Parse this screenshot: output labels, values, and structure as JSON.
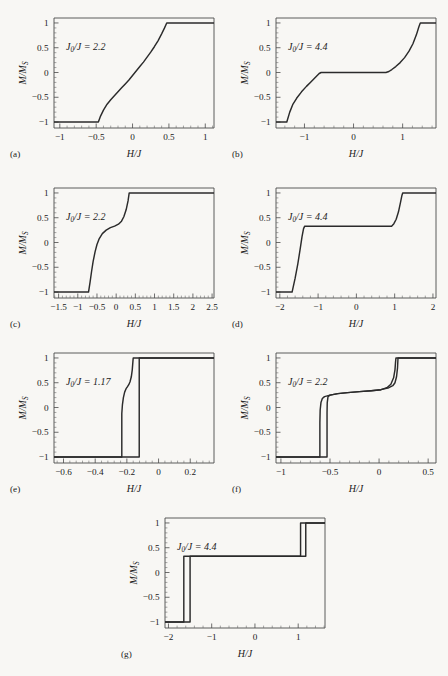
{
  "figure": {
    "background_color": "#f8f7f4",
    "curve_color": "#2b2b2b",
    "axis_color": "#4a4a4a",
    "y_axis_label": "M/M",
    "y_axis_label_sub": "S",
    "x_axis_label": "H/J",
    "annotation_prefix": "J",
    "annotation_sub": "0",
    "annotation_mid": "/J = "
  },
  "panels": [
    {
      "tag": "(a)",
      "annotation_value": "2.2",
      "annotation_full": "J0/J = 2.2",
      "x_ticks": [
        -1,
        -0.5,
        0,
        0.5,
        1
      ],
      "x_tick_labels": [
        "−1",
        "−0.5",
        "0",
        "0.5",
        "1"
      ],
      "y_ticks": [
        -1,
        -0.5,
        0,
        0.5,
        1
      ],
      "y_tick_labels": [
        "−1",
        "−0.5",
        "0",
        "0.5",
        "1"
      ],
      "xlim": [
        -1.08,
        1.12
      ],
      "ylim": [
        -1.12,
        1.1
      ]
    },
    {
      "tag": "(b)",
      "annotation_value": "4.4",
      "annotation_full": "J0/J = 4.4",
      "x_ticks": [
        -1,
        0,
        1
      ],
      "x_tick_labels": [
        "−1",
        "0",
        "1"
      ],
      "y_ticks": [
        -1,
        -0.5,
        0,
        0.5,
        1
      ],
      "y_tick_labels": [
        "−1",
        "−0.5",
        "0",
        "0.5",
        "1"
      ],
      "xlim": [
        -1.58,
        1.68
      ],
      "ylim": [
        -1.12,
        1.1
      ]
    },
    {
      "tag": "(c)",
      "annotation_value": "2.2",
      "annotation_full": "J0/J = 2.2",
      "x_ticks": [
        -1.5,
        -1,
        -0.5,
        0,
        0.5,
        1,
        1.5,
        2,
        2.5
      ],
      "x_tick_labels": [
        "−1.5",
        "−1",
        "−0.5",
        "0",
        "0.5",
        "1",
        "1.5",
        "2",
        "2.5"
      ],
      "y_ticks": [
        -1,
        -0.5,
        0,
        0.5,
        1
      ],
      "y_tick_labels": [
        "−1",
        "−0.5",
        "0",
        "0.5",
        "1"
      ],
      "xlim": [
        -1.62,
        2.55
      ],
      "ylim": [
        -1.12,
        1.1
      ]
    },
    {
      "tag": "(d)",
      "annotation_value": "4.4",
      "annotation_full": "J0/J = 4.4",
      "x_ticks": [
        -2,
        -1,
        0,
        1,
        2
      ],
      "x_tick_labels": [
        "−2",
        "−1",
        "0",
        "1",
        "2"
      ],
      "y_ticks": [
        -1,
        -0.5,
        0,
        0.5,
        1
      ],
      "y_tick_labels": [
        "−1",
        "−0.5",
        "0",
        "0.5",
        "1"
      ],
      "xlim": [
        -2.1,
        2.08
      ],
      "ylim": [
        -1.12,
        1.1
      ]
    },
    {
      "tag": "(e)",
      "annotation_value": "1.17",
      "annotation_full": "J0/J = 1.17",
      "x_ticks": [
        -0.6,
        -0.4,
        -0.2,
        0,
        0.2
      ],
      "x_tick_labels": [
        "−0.6",
        "−0.4",
        "−0.2",
        "0",
        "0.2"
      ],
      "y_ticks": [
        -1,
        -0.5,
        0,
        0.5,
        1
      ],
      "y_tick_labels": [
        "−1",
        "−0.5",
        "0",
        "0.5",
        "1"
      ],
      "xlim": [
        -0.66,
        0.35
      ],
      "ylim": [
        -1.12,
        1.1
      ]
    },
    {
      "tag": "(f)",
      "annotation_value": "2.2",
      "annotation_full": "J0/J = 2.2",
      "x_ticks": [
        -1,
        -0.5,
        0,
        0.5
      ],
      "x_tick_labels": [
        "−1",
        "−0.5",
        "0",
        "0.5"
      ],
      "y_ticks": [
        -1,
        -0.5,
        0,
        0.5,
        1
      ],
      "y_tick_labels": [
        "−1",
        "−0.5",
        "0",
        "0.5",
        "1"
      ],
      "xlim": [
        -1.05,
        0.58
      ],
      "ylim": [
        -1.12,
        1.1
      ]
    },
    {
      "tag": "(g)",
      "annotation_value": "4.4",
      "annotation_full": "J0/J = 4.4",
      "x_ticks": [
        -2,
        -1,
        0,
        1
      ],
      "x_tick_labels": [
        "−2",
        "−1",
        "0",
        "1"
      ],
      "y_ticks": [
        -1,
        -0.5,
        0,
        0.5,
        1
      ],
      "y_tick_labels": [
        "−1",
        "−0.5",
        "0",
        "0.5",
        "1"
      ],
      "xlim": [
        -2.08,
        1.62
      ],
      "ylim": [
        -1.12,
        1.1
      ]
    }
  ],
  "chart_data": [
    {
      "type": "line",
      "panel": "(a)",
      "title": "",
      "xlabel": "H/J",
      "ylabel": "M/M_S",
      "annotation": "J_0/J = 2.2",
      "xlim": [
        -1.08,
        1.12
      ],
      "ylim": [
        -1.12,
        1.1
      ],
      "grid": false,
      "legend": "none",
      "series": [
        {
          "name": "M/Ms vs H/J",
          "points": [
            [
              -1.08,
              -1.0
            ],
            [
              -0.47,
              -1.0
            ],
            [
              -0.44,
              -0.88
            ],
            [
              -0.4,
              -0.76
            ],
            [
              -0.35,
              -0.64
            ],
            [
              -0.3,
              -0.55
            ],
            [
              -0.25,
              -0.47
            ],
            [
              -0.2,
              -0.39
            ],
            [
              -0.15,
              -0.31
            ],
            [
              -0.1,
              -0.23
            ],
            [
              -0.05,
              -0.15
            ],
            [
              0.0,
              -0.06
            ],
            [
              0.05,
              0.03
            ],
            [
              0.1,
              0.12
            ],
            [
              0.15,
              0.21
            ],
            [
              0.2,
              0.31
            ],
            [
              0.25,
              0.41
            ],
            [
              0.3,
              0.52
            ],
            [
              0.35,
              0.64
            ],
            [
              0.4,
              0.78
            ],
            [
              0.44,
              0.9
            ],
            [
              0.47,
              1.0
            ],
            [
              1.12,
              1.0
            ]
          ]
        }
      ]
    },
    {
      "type": "line",
      "panel": "(b)",
      "xlabel": "H/J",
      "ylabel": "M/M_S",
      "annotation": "J_0/J = 4.4",
      "xlim": [
        -1.58,
        1.68
      ],
      "ylim": [
        -1.12,
        1.1
      ],
      "grid": false,
      "legend": "none",
      "series": [
        {
          "name": "M/Ms vs H/J",
          "points": [
            [
              -1.58,
              -1.0
            ],
            [
              -1.36,
              -1.0
            ],
            [
              -1.3,
              -0.8
            ],
            [
              -1.24,
              -0.65
            ],
            [
              -1.16,
              -0.52
            ],
            [
              -1.06,
              -0.39
            ],
            [
              -0.96,
              -0.28
            ],
            [
              -0.88,
              -0.2
            ],
            [
              -0.8,
              -0.12
            ],
            [
              -0.74,
              -0.06
            ],
            [
              -0.7,
              -0.02
            ],
            [
              -0.66,
              0.0
            ],
            [
              0.66,
              0.0
            ],
            [
              0.72,
              0.02
            ],
            [
              0.78,
              0.06
            ],
            [
              0.86,
              0.12
            ],
            [
              0.95,
              0.2
            ],
            [
              1.04,
              0.3
            ],
            [
              1.13,
              0.43
            ],
            [
              1.21,
              0.58
            ],
            [
              1.28,
              0.76
            ],
            [
              1.33,
              0.92
            ],
            [
              1.36,
              1.0
            ],
            [
              1.68,
              1.0
            ]
          ]
        }
      ]
    },
    {
      "type": "line",
      "panel": "(c)",
      "xlabel": "H/J",
      "ylabel": "M/M_S",
      "annotation": "J_0/J = 2.2",
      "xlim": [
        -1.62,
        2.55
      ],
      "ylim": [
        -1.12,
        1.1
      ],
      "grid": false,
      "legend": "none",
      "series": [
        {
          "name": "M/Ms vs H/J",
          "points": [
            [
              -1.62,
              -1.0
            ],
            [
              -0.72,
              -1.0
            ],
            [
              -0.68,
              -0.8
            ],
            [
              -0.64,
              -0.58
            ],
            [
              -0.6,
              -0.38
            ],
            [
              -0.55,
              -0.19
            ],
            [
              -0.5,
              -0.04
            ],
            [
              -0.44,
              0.08
            ],
            [
              -0.36,
              0.18
            ],
            [
              -0.26,
              0.25
            ],
            [
              -0.15,
              0.3
            ],
            [
              -0.04,
              0.33
            ],
            [
              0.06,
              0.37
            ],
            [
              0.14,
              0.43
            ],
            [
              0.2,
              0.52
            ],
            [
              0.26,
              0.66
            ],
            [
              0.31,
              0.84
            ],
            [
              0.34,
              1.0
            ],
            [
              2.55,
              1.0
            ]
          ]
        }
      ]
    },
    {
      "type": "line",
      "panel": "(d)",
      "xlabel": "H/J",
      "ylabel": "M/M_S",
      "annotation": "J_0/J = 4.4",
      "xlim": [
        -2.1,
        2.08
      ],
      "ylim": [
        -1.12,
        1.1
      ],
      "grid": false,
      "legend": "none",
      "series": [
        {
          "name": "M/Ms vs H/J",
          "points": [
            [
              -2.1,
              -1.0
            ],
            [
              -1.68,
              -1.0
            ],
            [
              -1.6,
              -0.72
            ],
            [
              -1.53,
              -0.43
            ],
            [
              -1.47,
              -0.14
            ],
            [
              -1.42,
              0.12
            ],
            [
              -1.38,
              0.28
            ],
            [
              -1.35,
              0.33
            ],
            [
              0.92,
              0.33
            ],
            [
              0.98,
              0.38
            ],
            [
              1.04,
              0.47
            ],
            [
              1.1,
              0.62
            ],
            [
              1.15,
              0.8
            ],
            [
              1.19,
              0.95
            ],
            [
              1.21,
              1.0
            ],
            [
              2.08,
              1.0
            ]
          ]
        }
      ]
    },
    {
      "type": "line",
      "panel": "(e)",
      "xlabel": "H/J",
      "ylabel": "M/M_S",
      "annotation": "J_0/J = 1.17",
      "xlim": [
        -0.66,
        0.35
      ],
      "ylim": [
        -1.12,
        1.1
      ],
      "grid": false,
      "legend": "none",
      "note": "hysteresis loop: two branches",
      "series": [
        {
          "name": "ascending-branch",
          "points": [
            [
              -0.66,
              -1.0
            ],
            [
              -0.232,
              -1.0
            ],
            [
              -0.232,
              -0.12
            ],
            [
              -0.228,
              0.06
            ],
            [
              -0.222,
              0.2
            ],
            [
              -0.214,
              0.31
            ],
            [
              -0.205,
              0.38
            ],
            [
              -0.196,
              0.42
            ],
            [
              -0.188,
              0.46
            ],
            [
              -0.18,
              0.52
            ],
            [
              -0.172,
              0.62
            ],
            [
              -0.166,
              0.76
            ],
            [
              -0.162,
              0.92
            ],
            [
              -0.16,
              1.0
            ],
            [
              0.35,
              1.0
            ]
          ]
        },
        {
          "name": "descending-branch",
          "points": [
            [
              0.35,
              1.0
            ],
            [
              -0.122,
              1.0
            ],
            [
              -0.122,
              -1.0
            ],
            [
              -0.66,
              -1.0
            ]
          ]
        }
      ]
    },
    {
      "type": "line",
      "panel": "(f)",
      "xlabel": "H/J",
      "ylabel": "M/M_S",
      "annotation": "J_0/J = 2.2",
      "xlim": [
        -1.05,
        0.58
      ],
      "ylim": [
        -1.12,
        1.1
      ],
      "grid": false,
      "legend": "none",
      "note": "hysteresis loop: two branches",
      "series": [
        {
          "name": "ascending-branch",
          "points": [
            [
              -1.05,
              -1.0
            ],
            [
              -0.603,
              -1.0
            ],
            [
              -0.603,
              -0.3
            ],
            [
              -0.6,
              -0.05
            ],
            [
              -0.592,
              0.1
            ],
            [
              -0.578,
              0.18
            ],
            [
              -0.556,
              0.22
            ],
            [
              -0.5,
              0.25
            ],
            [
              -0.42,
              0.28
            ],
            [
              -0.32,
              0.3
            ],
            [
              -0.2,
              0.32
            ],
            [
              -0.08,
              0.34
            ],
            [
              0.02,
              0.36
            ],
            [
              0.08,
              0.4
            ],
            [
              0.12,
              0.47
            ],
            [
              0.148,
              0.6
            ],
            [
              0.162,
              0.76
            ],
            [
              0.168,
              0.92
            ],
            [
              0.172,
              1.0
            ],
            [
              0.58,
              1.0
            ]
          ]
        },
        {
          "name": "descending-branch",
          "points": [
            [
              0.58,
              1.0
            ],
            [
              0.193,
              1.0
            ],
            [
              0.188,
              0.8
            ],
            [
              0.178,
              0.62
            ],
            [
              0.162,
              0.5
            ],
            [
              0.14,
              0.44
            ],
            [
              0.1,
              0.4
            ],
            [
              0.02,
              0.36
            ],
            [
              -0.08,
              0.34
            ],
            [
              -0.2,
              0.32
            ],
            [
              -0.32,
              0.3
            ],
            [
              -0.42,
              0.28
            ],
            [
              -0.5,
              0.25
            ],
            [
              -0.52,
              0.22
            ],
            [
              -0.528,
              0.1
            ],
            [
              -0.53,
              -0.1
            ],
            [
              -0.53,
              -1.0
            ],
            [
              -1.05,
              -1.0
            ]
          ]
        }
      ]
    },
    {
      "type": "line",
      "panel": "(g)",
      "xlabel": "H/J",
      "ylabel": "M/M_S",
      "annotation": "J_0/J = 4.4",
      "xlim": [
        -2.08,
        1.62
      ],
      "ylim": [
        -1.12,
        1.1
      ],
      "grid": false,
      "legend": "none",
      "note": "rectangular hysteresis loop: two branches",
      "series": [
        {
          "name": "ascending-branch",
          "points": [
            [
              -2.08,
              -1.0
            ],
            [
              -1.645,
              -1.0
            ],
            [
              -1.645,
              0.33
            ],
            [
              1.055,
              0.33
            ],
            [
              1.055,
              1.0
            ],
            [
              1.62,
              1.0
            ]
          ]
        },
        {
          "name": "descending-branch",
          "points": [
            [
              1.62,
              1.0
            ],
            [
              1.175,
              1.0
            ],
            [
              1.175,
              0.33
            ],
            [
              -1.5,
              0.33
            ],
            [
              -1.5,
              -1.0
            ],
            [
              -2.08,
              -1.0
            ]
          ]
        }
      ]
    }
  ]
}
